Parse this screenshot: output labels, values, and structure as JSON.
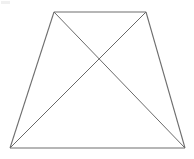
{
  "figure": {
    "name": "trapezoid-with-diagonals",
    "background_color": "#ffffff",
    "canvas": {
      "width": 194,
      "height": 159
    },
    "stroke": {
      "outline_color": "#6e6e6e",
      "diagonal_color": "#585858",
      "outline_width": 1.1,
      "diagonal_width": 0.9
    },
    "vertices": {
      "top_left": {
        "label": "A",
        "x": 54,
        "y": 12
      },
      "top_right": {
        "label": "B",
        "x": 146,
        "y": 12
      },
      "bottom_right": {
        "label": "C",
        "x": 185,
        "y": 148
      },
      "bottom_left": {
        "label": "D",
        "x": 10,
        "y": 148
      }
    },
    "intersection": {
      "label": "E",
      "x": 99,
      "y": 60
    },
    "outline_points": "54,12 146,12 185,148 10,148",
    "diagonals": [
      {
        "name": "diagonal-tl-br",
        "x1": 54,
        "y1": 12,
        "x2": 185,
        "y2": 148
      },
      {
        "name": "diagonal-tr-bl",
        "x1": 146,
        "y1": 12,
        "x2": 10,
        "y2": 148
      }
    ],
    "edges": [
      {
        "name": "top-edge",
        "x1": 54,
        "y1": 12,
        "x2": 146,
        "y2": 12
      },
      {
        "name": "right-edge",
        "x1": 146,
        "y1": 12,
        "x2": 185,
        "y2": 148
      },
      {
        "name": "bottom-edge",
        "x1": 185,
        "y1": 148,
        "x2": 10,
        "y2": 148
      },
      {
        "name": "left-edge",
        "x1": 10,
        "y1": 148,
        "x2": 54,
        "y2": 12
      }
    ]
  }
}
